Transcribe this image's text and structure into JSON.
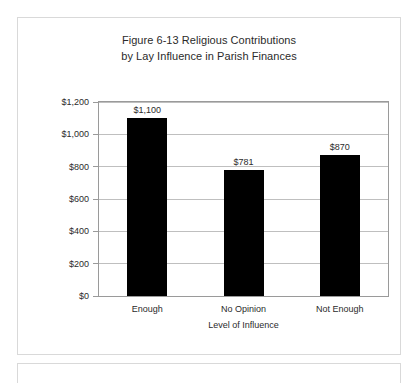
{
  "figure": {
    "title_line1": "Figure 6-13 Religious Contributions",
    "title_line2": "by Lay Influence in Parish Finances"
  },
  "chart_data": {
    "type": "bar",
    "title": "Figure 6-13 Religious Contributions by Lay Influence in Parish Finances",
    "xlabel": "Level of Influence",
    "ylabel": "Contributions",
    "categories": [
      "Enough",
      "No Opinion",
      "Not Enough"
    ],
    "values": [
      1100,
      781,
      870
    ],
    "value_labels": [
      "$1,100",
      "$781",
      "$870"
    ],
    "ylim": [
      0,
      1200
    ],
    "ytick_values": [
      0,
      200,
      400,
      600,
      800,
      1000,
      1200
    ],
    "ytick_labels": [
      "$0",
      "$200",
      "$400",
      "$600",
      "$800",
      "$1,000",
      "$1,200"
    ],
    "grid": true,
    "grid_axis": "y",
    "legend": false,
    "bar_color": "#000000",
    "grid_color": "#bfbfbf",
    "axis_color": "#9a9a9a",
    "text_color": "#2b2b2b",
    "background_color": "#ffffff"
  }
}
